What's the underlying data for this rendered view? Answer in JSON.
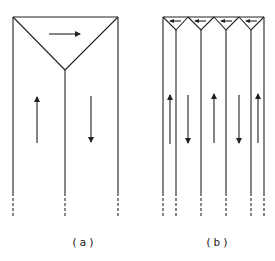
{
  "diagram": {
    "type": "flow-channel-schematic",
    "stroke_color": "#222222",
    "panels": [
      {
        "id": "a",
        "label": "(a)",
        "description": "Single large triangular header feeding two parallel channels",
        "top_arrow": "right",
        "channel_arrows": [
          "up",
          "down"
        ]
      },
      {
        "id": "b",
        "label": "(b)",
        "description": "Four small triangular headers feeding multiple narrow channels",
        "top_arrows": [
          "left",
          "left",
          "left",
          "left"
        ],
        "channel_arrows": [
          "up",
          "down",
          "up",
          "down",
          "up"
        ]
      }
    ]
  }
}
